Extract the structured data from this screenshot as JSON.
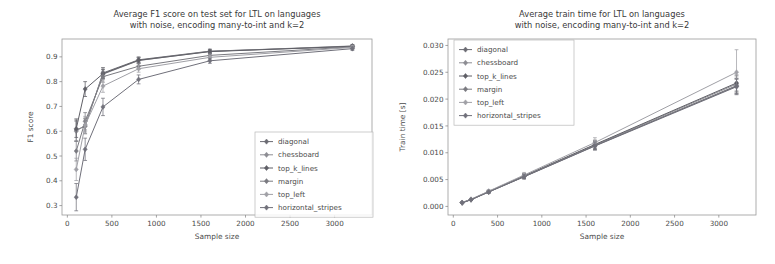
{
  "figure": {
    "width": 775,
    "height": 264,
    "background": "#ffffff"
  },
  "series_names": [
    "diagonal",
    "chessboard",
    "top_k_lines",
    "margin",
    "top_left",
    "horizontal_stripes"
  ],
  "series_colors": [
    "#6b6b72",
    "#8d8d93",
    "#5f5f66",
    "#7a7a80",
    "#a0a0a6",
    "#70707a"
  ],
  "chart_data": [
    {
      "type": "line",
      "id": "f1-chart",
      "title": "Average F1 score on test set for LTL on languages\nwith noise, encoding many-to-int and k=2",
      "title_line1": "Average F1 score on test set for LTL on languages",
      "title_line2": "with noise, encoding many-to-int and k=2",
      "xlabel": "Sample size",
      "ylabel": "F1 score",
      "x": [
        100,
        200,
        400,
        800,
        1600,
        3200
      ],
      "xlim": [
        -60,
        3420
      ],
      "ylim": [
        0.262,
        0.972
      ],
      "xticks": [
        0,
        500,
        1000,
        1500,
        2000,
        2500,
        3000
      ],
      "xticklabels": [
        "0",
        "500",
        "1000",
        "1500",
        "2000",
        "2500",
        "3000"
      ],
      "yticks": [
        0.3,
        0.4,
        0.5,
        0.6,
        0.7,
        0.8,
        0.9
      ],
      "yticklabels": [
        "0.3",
        "0.4",
        "0.5",
        "0.6",
        "0.7",
        "0.8",
        "0.9"
      ],
      "grid": false,
      "legend_position": "lower right",
      "series": [
        {
          "name": "diagonal",
          "values": [
            0.605,
            0.62,
            0.835,
            0.888,
            0.923,
            0.941
          ],
          "errors": [
            0.045,
            0.03,
            0.022,
            0.012,
            0.008,
            0.006
          ]
        },
        {
          "name": "chessboard",
          "values": [
            0.6,
            0.625,
            0.83,
            0.885,
            0.922,
            0.944
          ],
          "errors": [
            0.04,
            0.028,
            0.02,
            0.012,
            0.008,
            0.006
          ]
        },
        {
          "name": "top_k_lines",
          "values": [
            0.61,
            0.77,
            0.832,
            0.886,
            0.921,
            0.943
          ],
          "errors": [
            0.035,
            0.03,
            0.018,
            0.01,
            0.007,
            0.005
          ]
        },
        {
          "name": "margin",
          "values": [
            0.52,
            0.64,
            0.82,
            0.862,
            0.906,
            0.94
          ],
          "errors": [
            0.04,
            0.035,
            0.022,
            0.012,
            0.008,
            0.006
          ]
        },
        {
          "name": "top_left",
          "values": [
            0.446,
            0.625,
            0.782,
            0.852,
            0.898,
            0.938
          ],
          "errors": [
            0.045,
            0.035,
            0.025,
            0.014,
            0.009,
            0.006
          ]
        },
        {
          "name": "horizontal_stripes",
          "values": [
            0.334,
            0.527,
            0.698,
            0.809,
            0.884,
            0.933
          ],
          "errors": [
            0.055,
            0.045,
            0.035,
            0.018,
            0.01,
            0.007
          ]
        }
      ]
    },
    {
      "type": "line",
      "id": "traintime-chart",
      "title": "Average train time for LTL on languages\nwith noise, encoding many-to-int and k=2",
      "title_line1": "Average train time for LTL on languages",
      "title_line2": "with noise, encoding many-to-int and k=2",
      "xlabel": "Sample size",
      "ylabel": "Train time [s]",
      "x": [
        100,
        200,
        400,
        800,
        1600,
        3200
      ],
      "xlim": [
        -60,
        3420
      ],
      "ylim": [
        -0.0016,
        0.0312
      ],
      "xticks": [
        0,
        500,
        1000,
        1500,
        2000,
        2500,
        3000
      ],
      "xticklabels": [
        "0",
        "500",
        "1000",
        "1500",
        "2000",
        "2500",
        "3000"
      ],
      "yticks": [
        0.0,
        0.005,
        0.01,
        0.015,
        0.02,
        0.025,
        0.03
      ],
      "yticklabels": [
        "0.000",
        "0.005",
        "0.010",
        "0.015",
        "0.020",
        "0.025",
        "0.030"
      ],
      "grid": false,
      "legend_position": "upper left",
      "series": [
        {
          "name": "diagonal",
          "values": [
            0.00068,
            0.00125,
            0.0027,
            0.00555,
            0.0113,
            0.0225
          ],
          "errors": [
            0.00012,
            0.00014,
            0.0002,
            0.0004,
            0.00075,
            0.0014
          ]
        },
        {
          "name": "chessboard",
          "values": [
            0.0007,
            0.00128,
            0.00275,
            0.00562,
            0.01145,
            0.0228
          ],
          "errors": [
            0.00012,
            0.00014,
            0.0002,
            0.0004,
            0.00075,
            0.0015
          ]
        },
        {
          "name": "top_k_lines",
          "values": [
            0.00072,
            0.0013,
            0.00278,
            0.0057,
            0.01155,
            0.023
          ],
          "errors": [
            0.00012,
            0.00015,
            0.00022,
            0.00042,
            0.0008,
            0.0015
          ]
        },
        {
          "name": "margin",
          "values": [
            0.00069,
            0.00126,
            0.00272,
            0.00558,
            0.01138,
            0.0224
          ],
          "errors": [
            0.00012,
            0.00014,
            0.0002,
            0.0004,
            0.00075,
            0.0014
          ]
        },
        {
          "name": "top_left",
          "values": [
            0.00074,
            0.00134,
            0.00285,
            0.00585,
            0.0119,
            0.025
          ],
          "errors": [
            0.00013,
            0.00016,
            0.00024,
            0.00048,
            0.0009,
            0.0042
          ]
        },
        {
          "name": "horizontal_stripes",
          "values": [
            0.00067,
            0.00124,
            0.00268,
            0.00552,
            0.01125,
            0.0223
          ],
          "errors": [
            0.00012,
            0.00014,
            0.0002,
            0.0004,
            0.00075,
            0.0014
          ]
        }
      ]
    }
  ]
}
